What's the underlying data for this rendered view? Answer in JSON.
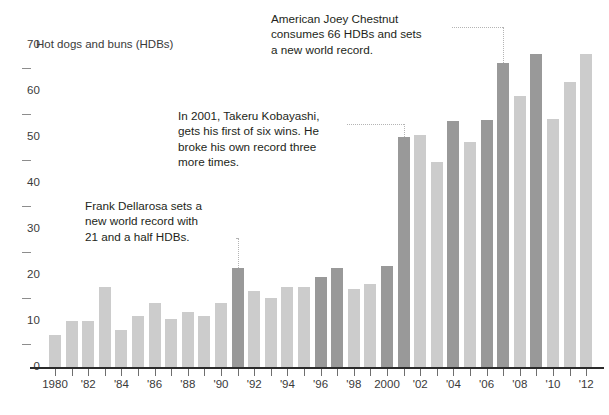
{
  "chart_data": {
    "type": "bar",
    "title": "",
    "ylabel": "Hot dogs and buns (HDBs)",
    "xlabel": "",
    "ylim": [
      0,
      70
    ],
    "ytick_values": [
      0,
      10,
      20,
      30,
      40,
      50,
      60,
      70
    ],
    "ytick_labels": [
      "0",
      "10",
      "20",
      "30",
      "40",
      "50",
      "60",
      "70"
    ],
    "yminor_values": [
      5,
      15,
      25,
      35,
      45,
      55,
      65
    ],
    "grid": false,
    "legend": "none",
    "categories": [
      "1980",
      "1981",
      "1982",
      "1983",
      "1984",
      "1985",
      "1986",
      "1987",
      "1988",
      "1989",
      "1990",
      "1991",
      "1992",
      "1993",
      "1994",
      "1995",
      "1996",
      "1997",
      "1998",
      "1999",
      "2000",
      "2001",
      "2002",
      "2003",
      "2004",
      "2005",
      "2006",
      "2007",
      "2008",
      "2009",
      "2010",
      "2011",
      "2012"
    ],
    "xtick_labels": [
      "1980",
      "",
      "'82",
      "",
      "'84",
      "",
      "'86",
      "",
      "'88",
      "",
      "'90",
      "",
      "'92",
      "",
      "'94",
      "",
      "'96",
      "",
      "'98",
      "",
      "2000",
      "",
      "'02",
      "",
      "'04",
      "",
      "'06",
      "",
      "'08",
      "",
      "'10",
      "",
      "'12"
    ],
    "values": [
      7,
      10,
      10,
      17.5,
      8,
      11,
      14,
      10.5,
      12,
      11,
      14,
      21.5,
      16.5,
      15,
      17.5,
      17.5,
      19.5,
      21.5,
      17,
      18,
      22,
      50,
      50.5,
      44.5,
      53.5,
      49,
      53.75,
      66,
      59,
      68,
      54,
      62,
      68
    ],
    "highlight": [
      false,
      false,
      false,
      false,
      false,
      false,
      false,
      false,
      false,
      false,
      false,
      true,
      false,
      false,
      false,
      false,
      true,
      true,
      false,
      false,
      true,
      true,
      false,
      false,
      true,
      false,
      true,
      true,
      false,
      true,
      false,
      false,
      false
    ],
    "colors": {
      "bar_normal": "#cccccc",
      "bar_highlight": "#999999",
      "axis": "#2b2b2b",
      "text": "#231f20",
      "leader": "#b4b4b4"
    },
    "annotations": [
      {
        "id": "dellarosa",
        "text": "Frank Dellarosa sets a\nnew world record with\n21 and a half HDBs.",
        "target_category": "1991",
        "target_value": 21.5
      },
      {
        "id": "kobayashi",
        "text": "In 2001, Takeru Kobayashi,\ngets his first of six wins. He\nbroke his own record three\nmore times.",
        "target_category": "2001",
        "target_value": 50
      },
      {
        "id": "chestnut",
        "text": "American Joey Chestnut\nconsumes 66 HDBs and sets\na new world record.",
        "target_category": "2007",
        "target_value": 66
      }
    ]
  }
}
